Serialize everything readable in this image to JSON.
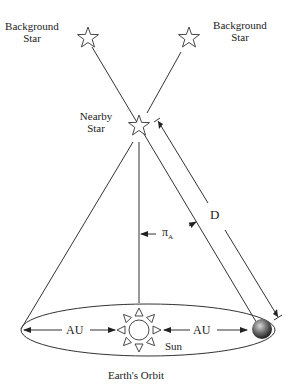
{
  "labels": {
    "background_star_left": [
      "Background",
      "Star"
    ],
    "background_star_right": [
      "Background",
      "Star"
    ],
    "nearby_star": [
      "Nearby",
      "Star"
    ],
    "distance": "D",
    "parallax_angle": "π",
    "parallax_subscript": "A",
    "au_left": "AU",
    "au_right": "AU",
    "sun": "Sun",
    "orbit": "Earth's Orbit"
  },
  "colors": {
    "line": "#333333",
    "earth_dark": "#2a2a2a",
    "earth_light": "#bdbdbd"
  }
}
